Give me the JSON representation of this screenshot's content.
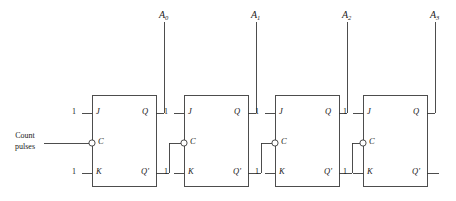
{
  "diagram": {
    "type": "logic-circuit-schematic",
    "line_color": "#3a3a3a",
    "background": "#ffffff",
    "clock_input": {
      "label_line1": "Count",
      "label_line2": "pulses"
    },
    "constant_input_value": "1",
    "pins": {
      "j": "J",
      "c": "C",
      "k": "K",
      "q": "Q",
      "qbar": "Q'"
    },
    "outputs": [
      {
        "name": "A",
        "subscript": "0"
      },
      {
        "name": "A",
        "subscript": "1"
      },
      {
        "name": "A",
        "subscript": "2"
      },
      {
        "name": "A",
        "subscript": "3"
      }
    ],
    "stages": [
      {
        "index": 0,
        "j_value": "1",
        "k_value": "1",
        "clock_inverted": true,
        "clock_source": "count-pulses",
        "q_output": "A0",
        "qbar_connected_to": "stage-1-clock"
      },
      {
        "index": 1,
        "j_value": "1",
        "k_value": "1",
        "clock_inverted": true,
        "clock_source": "stage-0-qbar",
        "q_output": "A1",
        "qbar_connected_to": "stage-2-clock"
      },
      {
        "index": 2,
        "j_value": "1",
        "k_value": "1",
        "clock_inverted": true,
        "clock_source": "stage-1-qbar",
        "q_output": "A2",
        "qbar_connected_to": "stage-3-clock"
      },
      {
        "index": 3,
        "j_value": "1",
        "k_value": "1",
        "clock_inverted": true,
        "clock_source": "stage-2-qbar",
        "q_output": "A3",
        "qbar_connected_to": "none"
      }
    ],
    "geometry": {
      "box_left": [
        92,
        184,
        275,
        363
      ],
      "box_width": 64,
      "box_top": 95,
      "box_bottom": 186,
      "row_j": 113,
      "row_c": 143,
      "row_k": 173,
      "output_riser_offset": 8,
      "output_label_y": 12
    }
  }
}
